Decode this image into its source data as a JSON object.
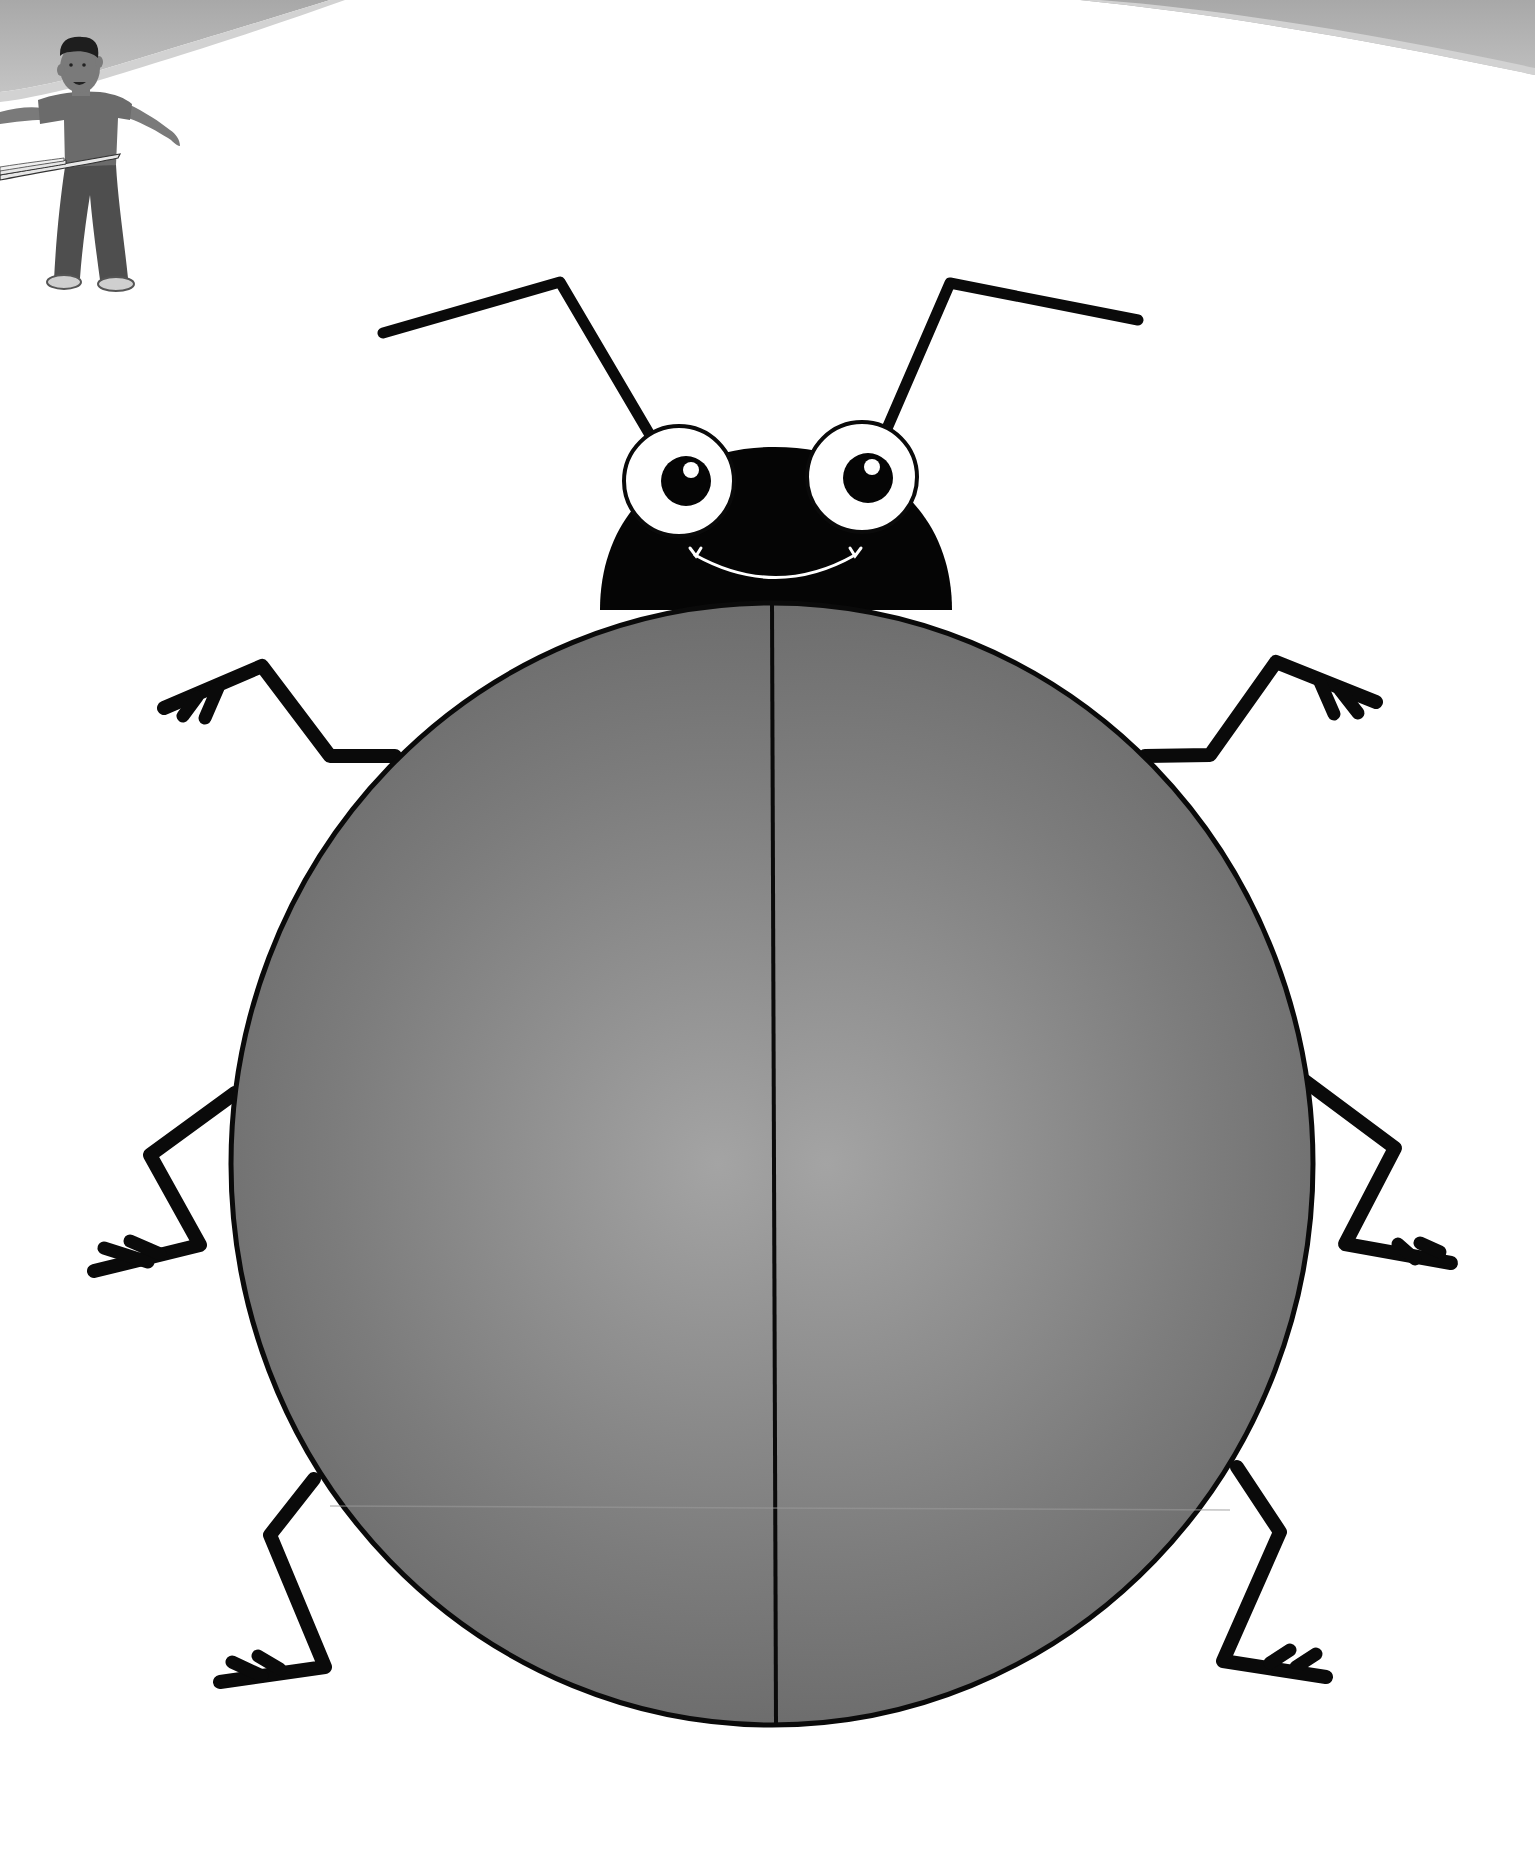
{
  "scene": {
    "subject": "cartoon beetle coloring page",
    "background_color": "#ffffff",
    "header_swoosh_color": "#b4b4b4",
    "header_swoosh_edge_color": "#d2d2d2"
  },
  "character": {
    "description": "boy with hula hoop",
    "shirt_color": "#6b6b6b",
    "pants_color": "#4e4e4e",
    "skin_color": "#7a7a7a",
    "hair_color": "#1e1e1e",
    "shoe_color": "#cfcfcf",
    "hoop_color": "#e6e6e6"
  },
  "beetle": {
    "outline_color": "#0a0a0a",
    "head_color": "#050505",
    "shell_color": "#7c7c7c",
    "shell_highlight_color": "#a4a4a4",
    "shell_shadow_color": "#5e5e5e",
    "eye_white_color": "#ffffff",
    "pupil_color": "#050505",
    "smile_color": "#ffffff",
    "eye_count": 2,
    "leg_count": 6,
    "antenna_count": 2
  }
}
